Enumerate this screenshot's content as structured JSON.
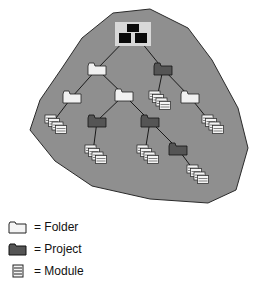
{
  "diagram": {
    "colors": {
      "region_fill": "#8f8f8f",
      "region_stroke": "#2a2a2a",
      "folder_fill": "#f1f1f1",
      "project_fill": "#555555",
      "root_bg": "#d8d8d8",
      "root_icon": "#0a0a0a",
      "module_fill": "#f4f4f4",
      "edge": "#1a1a1a"
    },
    "nodes": [
      {
        "id": "root",
        "type": "root",
        "x": 133,
        "y": 32
      },
      {
        "id": "f1",
        "type": "folder",
        "x": 97,
        "y": 69
      },
      {
        "id": "p1",
        "type": "project",
        "x": 163,
        "y": 69
      },
      {
        "id": "f2",
        "type": "folder",
        "x": 72,
        "y": 97
      },
      {
        "id": "f3",
        "type": "folder",
        "x": 124,
        "y": 95
      },
      {
        "id": "m_p1",
        "type": "module",
        "x": 157,
        "y": 98
      },
      {
        "id": "f4",
        "type": "folder",
        "x": 190,
        "y": 97
      },
      {
        "id": "m_f2",
        "type": "module",
        "x": 53,
        "y": 122
      },
      {
        "id": "p2",
        "type": "project",
        "x": 97,
        "y": 121
      },
      {
        "id": "p3",
        "type": "project",
        "x": 150,
        "y": 121
      },
      {
        "id": "m_f4",
        "type": "module",
        "x": 210,
        "y": 122
      },
      {
        "id": "m_p2",
        "type": "module",
        "x": 93,
        "y": 152
      },
      {
        "id": "m_p3",
        "type": "module",
        "x": 145,
        "y": 152
      },
      {
        "id": "p4",
        "type": "project",
        "x": 178,
        "y": 149
      },
      {
        "id": "m_p4",
        "type": "module",
        "x": 195,
        "y": 172
      }
    ],
    "edges": [
      [
        "root",
        "f1"
      ],
      [
        "root",
        "p1"
      ],
      [
        "f1",
        "f2"
      ],
      [
        "f1",
        "f3"
      ],
      [
        "p1",
        "m_p1"
      ],
      [
        "p1",
        "f4"
      ],
      [
        "f2",
        "m_f2"
      ],
      [
        "f3",
        "p2"
      ],
      [
        "f3",
        "p3"
      ],
      [
        "f4",
        "m_f4"
      ],
      [
        "p2",
        "m_p2"
      ],
      [
        "p3",
        "m_p3"
      ],
      [
        "p3",
        "p4"
      ],
      [
        "p4",
        "m_p4"
      ]
    ]
  },
  "legend": {
    "items": [
      {
        "icon": "folder-icon",
        "label": "= Folder"
      },
      {
        "icon": "project-icon",
        "label": "= Project"
      },
      {
        "icon": "module-icon",
        "label": "= Module"
      }
    ]
  }
}
